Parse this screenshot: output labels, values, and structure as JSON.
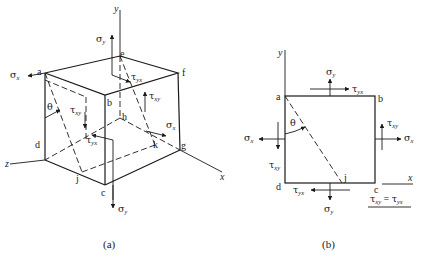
{
  "figure_a": {
    "caption": "(a)",
    "axes": {
      "x": "x",
      "y": "y",
      "z": "z"
    },
    "vertices": {
      "a": "a",
      "b": "b",
      "c": "c",
      "d": "d",
      "e": "e",
      "f": "f",
      "g": "g",
      "h": "h",
      "j": "j",
      "k": "k"
    },
    "angle": "θ",
    "stresses": {
      "sigma_x_left": {
        "sym": "σ",
        "sub": "x"
      },
      "sigma_x_right": {
        "sym": "σ",
        "sub": "x"
      },
      "sigma_y_top": {
        "sym": "σ",
        "sub": "y"
      },
      "sigma_y_bottom": {
        "sym": "σ",
        "sub": "y"
      },
      "tau_yx_top": {
        "sym": "τ",
        "sub": "yx"
      },
      "tau_xy_right": {
        "sym": "τ",
        "sub": "xy"
      },
      "tau_xy_left": {
        "sym": "τ",
        "sub": "xy"
      },
      "tau_yx_bottom": {
        "sym": "τ",
        "sub": "yx"
      }
    }
  },
  "figure_b": {
    "caption": "(b)",
    "axes": {
      "x": "x",
      "y": "y"
    },
    "vertices": {
      "a": "a",
      "b": "b",
      "c": "c",
      "d": "d",
      "j": "j"
    },
    "angle": "θ",
    "stresses": {
      "sigma_y_top": {
        "sym": "σ",
        "sub": "y"
      },
      "tau_yx_top": {
        "sym": "τ",
        "sub": "yx"
      },
      "tau_xy_right": {
        "sym": "τ",
        "sub": "xy"
      },
      "sigma_x_right": {
        "sym": "σ",
        "sub": "x"
      },
      "sigma_x_left": {
        "sym": "σ",
        "sub": "x"
      },
      "tau_xy_left": {
        "sym": "τ",
        "sub": "xy"
      },
      "tau_yx_bottom": {
        "sym": "τ",
        "sub": "yx"
      },
      "sigma_y_bottom": {
        "sym": "σ",
        "sub": "y"
      }
    },
    "equation": {
      "lhs_sym": "τ",
      "lhs_sub": "xy",
      "eq": " = ",
      "rhs_sym": "τ",
      "rhs_sub": "yx"
    }
  }
}
